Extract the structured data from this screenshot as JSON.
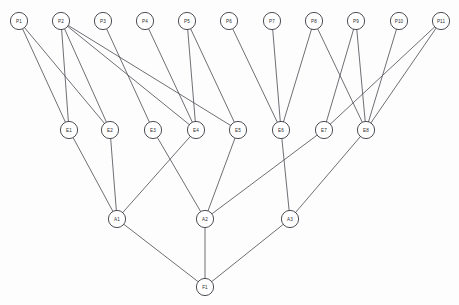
{
  "diagram": {
    "type": "layered-directed-graph",
    "canvas": {
      "width": 459,
      "height": 305
    },
    "style": {
      "node_fill": "#ffffff",
      "node_stroke": "#3a3a42",
      "edge_stroke": "#4a4a52",
      "background": "#fdfdfd",
      "node_radius": 8.6,
      "label_font_size": 4.6
    },
    "layers": [
      {
        "name": "P",
        "y": 21,
        "count": 11
      },
      {
        "name": "E",
        "y": 130,
        "count": 8
      },
      {
        "name": "A",
        "y": 219,
        "count": 3
      },
      {
        "name": "F",
        "y": 287,
        "count": 1
      }
    ],
    "nodes": [
      {
        "id": "P1",
        "label": "P1",
        "x": 19,
        "y": 21,
        "layer": "P"
      },
      {
        "id": "P2",
        "label": "P2",
        "x": 61,
        "y": 21,
        "layer": "P"
      },
      {
        "id": "P3",
        "label": "P3",
        "x": 103,
        "y": 21,
        "layer": "P"
      },
      {
        "id": "P4",
        "label": "P4",
        "x": 145,
        "y": 21,
        "layer": "P"
      },
      {
        "id": "P5",
        "label": "P5",
        "x": 187,
        "y": 21,
        "layer": "P"
      },
      {
        "id": "P6",
        "label": "P6",
        "x": 229,
        "y": 21,
        "layer": "P"
      },
      {
        "id": "P7",
        "label": "P7",
        "x": 272,
        "y": 21,
        "layer": "P"
      },
      {
        "id": "P8",
        "label": "P8",
        "x": 314,
        "y": 21,
        "layer": "P"
      },
      {
        "id": "P9",
        "label": "P9",
        "x": 356,
        "y": 21,
        "layer": "P"
      },
      {
        "id": "P10",
        "label": "P10",
        "x": 399,
        "y": 21,
        "layer": "P"
      },
      {
        "id": "P11",
        "label": "P11",
        "x": 441,
        "y": 21,
        "layer": "P"
      },
      {
        "id": "E1",
        "label": "E1",
        "x": 69,
        "y": 130,
        "layer": "E"
      },
      {
        "id": "E2",
        "label": "E2",
        "x": 110,
        "y": 130,
        "layer": "E"
      },
      {
        "id": "E3",
        "label": "E3",
        "x": 153,
        "y": 130,
        "layer": "E"
      },
      {
        "id": "E4",
        "label": "E4",
        "x": 196,
        "y": 130,
        "layer": "E"
      },
      {
        "id": "E5",
        "label": "E5",
        "x": 238,
        "y": 130,
        "layer": "E"
      },
      {
        "id": "E6",
        "label": "E6",
        "x": 281,
        "y": 130,
        "layer": "E"
      },
      {
        "id": "E7",
        "label": "E7",
        "x": 324,
        "y": 130,
        "layer": "E"
      },
      {
        "id": "E8",
        "label": "E8",
        "x": 366,
        "y": 130,
        "layer": "E"
      },
      {
        "id": "A1",
        "label": "A1",
        "x": 117,
        "y": 219,
        "layer": "A"
      },
      {
        "id": "A2",
        "label": "A2",
        "x": 205,
        "y": 219,
        "layer": "A"
      },
      {
        "id": "A3",
        "label": "A3",
        "x": 290,
        "y": 219,
        "layer": "A"
      },
      {
        "id": "F1",
        "label": "F1",
        "x": 205,
        "y": 287,
        "layer": "F"
      }
    ],
    "edges": [
      {
        "from": "P1",
        "to": "E1"
      },
      {
        "from": "P1",
        "to": "E2"
      },
      {
        "from": "P2",
        "to": "E1"
      },
      {
        "from": "P2",
        "to": "E2"
      },
      {
        "from": "P2",
        "to": "E4"
      },
      {
        "from": "P2",
        "to": "E5"
      },
      {
        "from": "P3",
        "to": "E3"
      },
      {
        "from": "P4",
        "to": "E4"
      },
      {
        "from": "P5",
        "to": "E4"
      },
      {
        "from": "P5",
        "to": "E5"
      },
      {
        "from": "P6",
        "to": "E6"
      },
      {
        "from": "P7",
        "to": "E6"
      },
      {
        "from": "P8",
        "to": "E6"
      },
      {
        "from": "P8",
        "to": "E8"
      },
      {
        "from": "P9",
        "to": "E7"
      },
      {
        "from": "P9",
        "to": "E8"
      },
      {
        "from": "P10",
        "to": "E8"
      },
      {
        "from": "P11",
        "to": "E7"
      },
      {
        "from": "P11",
        "to": "E8"
      },
      {
        "from": "E1",
        "to": "A1"
      },
      {
        "from": "E2",
        "to": "A1"
      },
      {
        "from": "E3",
        "to": "A2"
      },
      {
        "from": "E4",
        "to": "A1"
      },
      {
        "from": "E5",
        "to": "A2"
      },
      {
        "from": "E6",
        "to": "A3"
      },
      {
        "from": "E7",
        "to": "A2"
      },
      {
        "from": "E8",
        "to": "A3"
      },
      {
        "from": "A1",
        "to": "F1"
      },
      {
        "from": "A2",
        "to": "F1"
      },
      {
        "from": "A3",
        "to": "F1"
      }
    ]
  }
}
